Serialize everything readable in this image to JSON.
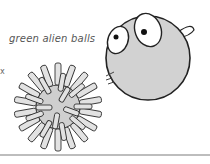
{
  "caption": "green alien balls",
  "edge_mark": "x",
  "illustrations": [
    {
      "name": "spiky-ball",
      "icon": "spiky-ball-icon"
    },
    {
      "name": "eyeball-ball",
      "icon": "alien-eye-ball-icon"
    }
  ],
  "colors": {
    "ball_fill": "#d2d2d2",
    "outline": "#222222",
    "caption": "#555555",
    "rule": "#bdbdbd"
  }
}
